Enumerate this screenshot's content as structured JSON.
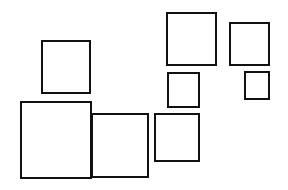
{
  "diagram": {
    "type": "square-arrangement",
    "background": "#ffffff",
    "stroke_color": "#111111",
    "stroke_width": 2.5,
    "squares": [
      {
        "id": "A",
        "x": 41,
        "y": 40,
        "w": 50,
        "h": 54
      },
      {
        "id": "B",
        "x": 20,
        "y": 101,
        "w": 72,
        "h": 78
      },
      {
        "id": "C",
        "x": 91,
        "y": 113,
        "w": 58,
        "h": 65
      },
      {
        "id": "D",
        "x": 166,
        "y": 12,
        "w": 51,
        "h": 54
      },
      {
        "id": "E",
        "x": 229,
        "y": 22,
        "w": 41,
        "h": 44
      },
      {
        "id": "F",
        "x": 167,
        "y": 72,
        "w": 33,
        "h": 36
      },
      {
        "id": "G",
        "x": 244,
        "y": 71,
        "w": 26,
        "h": 29
      },
      {
        "id": "H",
        "x": 154,
        "y": 113,
        "w": 46,
        "h": 49
      }
    ]
  }
}
